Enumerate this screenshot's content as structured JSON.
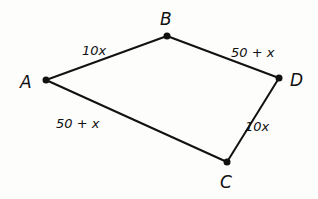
{
  "diagram": {
    "type": "graph",
    "vertices": [
      {
        "id": "A",
        "label": "A",
        "x": 46,
        "y": 80
      },
      {
        "id": "B",
        "label": "B",
        "x": 167,
        "y": 36
      },
      {
        "id": "D",
        "label": "D",
        "x": 279,
        "y": 78
      },
      {
        "id": "C",
        "label": "C",
        "x": 227,
        "y": 162
      }
    ],
    "edges": [
      {
        "from": "A",
        "to": "B",
        "label": "10x"
      },
      {
        "from": "B",
        "to": "D",
        "label": "50 + x"
      },
      {
        "from": "A",
        "to": "C",
        "label": "50 + x"
      },
      {
        "from": "D",
        "to": "C",
        "label": "10x"
      }
    ]
  }
}
